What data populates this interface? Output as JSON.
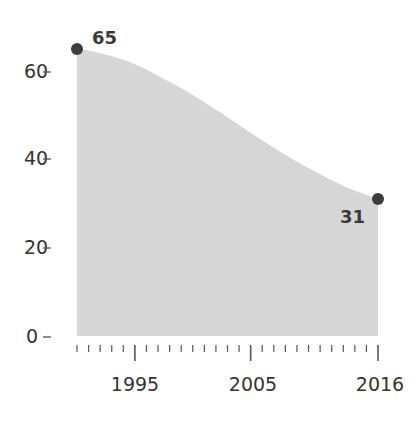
{
  "chart_data": {
    "type": "area",
    "title": "",
    "xlabel": "",
    "ylabel": "",
    "x": [
      1990,
      1992,
      1995,
      1998,
      2000,
      2003,
      2005,
      2008,
      2010,
      2013,
      2016
    ],
    "values": [
      65,
      64,
      61.5,
      57.5,
      54.5,
      49.5,
      46,
      41,
      38,
      34,
      31
    ],
    "series": [
      {
        "name": "value",
        "x": [
          1990,
          1992,
          1995,
          1998,
          2000,
          2003,
          2005,
          2008,
          2010,
          2013,
          2016
        ],
        "values": [
          65,
          64,
          61.5,
          57.5,
          54.5,
          49.5,
          46,
          41,
          38,
          34,
          31
        ]
      }
    ],
    "xlim": [
      1990,
      2016
    ],
    "ylim": [
      0,
      70
    ],
    "yticks": [
      0,
      20,
      40,
      60
    ],
    "ytick_labels": [
      "0",
      "20",
      "40",
      "60"
    ],
    "xticks_major": [
      1995,
      2005,
      2016
    ],
    "xtick_labels": [
      "1995",
      "2005",
      "2016"
    ],
    "xticks_minor_every": 1,
    "grid": false,
    "legend": null,
    "annotations": [
      {
        "x": 1990,
        "y": 65,
        "label": "65",
        "marker": "dot"
      },
      {
        "x": 2016,
        "y": 31,
        "label": "31",
        "marker": "dot"
      }
    ],
    "colors": {
      "fill": "#d6d6d6",
      "marker": "#3d3d3d",
      "text": "#333333",
      "axis": "#555555"
    }
  },
  "labels": {
    "start_value": "65",
    "end_value": "31",
    "y0": "0",
    "y20": "20",
    "y40": "40",
    "y60": "60",
    "x1995": "1995",
    "x2005": "2005",
    "x2016": "2016"
  }
}
